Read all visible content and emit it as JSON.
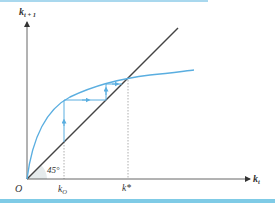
{
  "diagram": {
    "y_axis_label": "k",
    "y_axis_subscript": "t + 1",
    "x_axis_label": "k",
    "x_axis_subscript": "t",
    "origin_label": "O",
    "angle_label": "45°",
    "k0_label": "k",
    "k0_subscript": "O",
    "kstar_label": "k*",
    "colors": {
      "curve": "#5aaee0",
      "diagonal": "#444444",
      "axis": "#555555",
      "dashed": "#999999",
      "bar": "#7fcbe6",
      "angle_fill": "#e6ebec"
    }
  }
}
